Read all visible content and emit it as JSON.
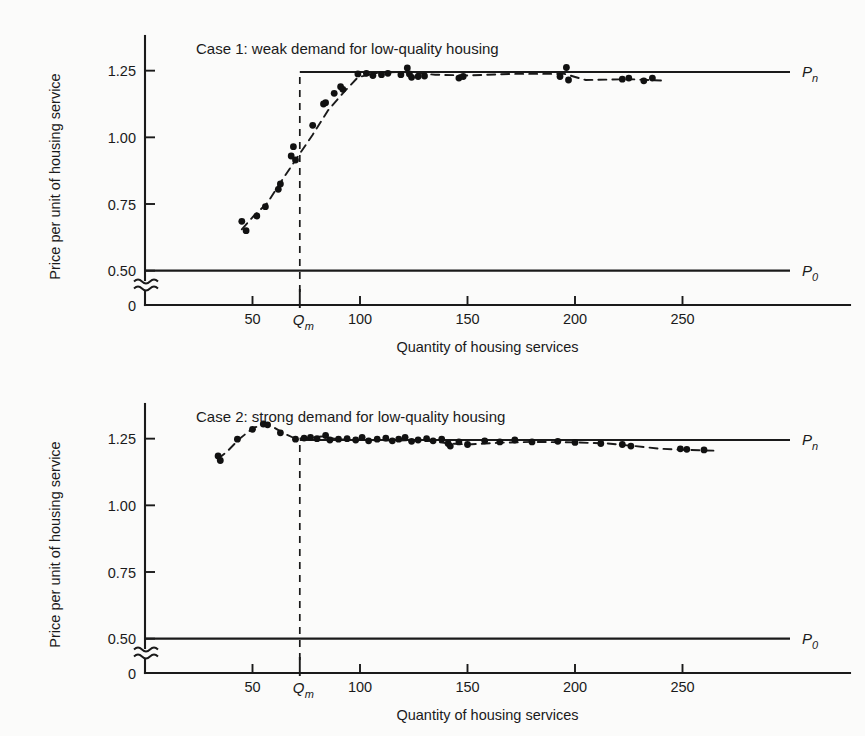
{
  "figure": {
    "background_color": "#fbfbfa",
    "ink_color": "#1a1a1a"
  },
  "chart_data": [
    {
      "type": "scatter",
      "panel_id": "case-1",
      "title": "Case 1: weak demand for  low-quality housing",
      "xlabel": "Quantity of housing services",
      "ylabel": "Price per unit of housing service",
      "xlim": [
        0,
        300
      ],
      "ylim": [
        0.42,
        1.38
      ],
      "grid": false,
      "legend_position": "right-of-axes",
      "xticks": [
        50,
        100,
        150,
        200,
        250
      ],
      "xticklabels": [
        "50",
        "100",
        "150",
        "200",
        "250"
      ],
      "yticks": [
        0.5,
        0.75,
        1.0,
        1.25
      ],
      "yticklabels": [
        "0.50",
        "0.75",
        "1.00",
        "1.25"
      ],
      "y_origin_label": "0",
      "axis_break": true,
      "annotations": [
        {
          "name": "qm-tick-label",
          "text": "Qm",
          "base": "Q",
          "sub": "m",
          "x": 72
        },
        {
          "name": "pn-line-label",
          "text": "Pn",
          "base": "P",
          "sub": "n",
          "y": 1.245
        },
        {
          "name": "p0-line-label",
          "text": "P0",
          "base": "P",
          "sub": "0",
          "y": 0.5
        }
      ],
      "reference_lines": [
        {
          "name": "pn",
          "label": "Pn",
          "value": 1.245,
          "start_x": 72,
          "style": "solid"
        },
        {
          "name": "p0",
          "label": "P0",
          "value": 0.5,
          "start_x": 0,
          "style": "solid"
        }
      ],
      "qm": 72,
      "fit_curve": [
        [
          45,
          0.655
        ],
        [
          50,
          0.7
        ],
        [
          57,
          0.755
        ],
        [
          63,
          0.83
        ],
        [
          70,
          0.915
        ],
        [
          78,
          1.01
        ],
        [
          85,
          1.1
        ],
        [
          92,
          1.165
        ],
        [
          99,
          1.225
        ],
        [
          108,
          1.242
        ],
        [
          120,
          1.245
        ],
        [
          135,
          1.235
        ],
        [
          150,
          1.232
        ],
        [
          170,
          1.238
        ],
        [
          195,
          1.238
        ],
        [
          205,
          1.215
        ],
        [
          225,
          1.218
        ],
        [
          240,
          1.213
        ]
      ],
      "points": [
        [
          45,
          0.685
        ],
        [
          47,
          0.65
        ],
        [
          52,
          0.705
        ],
        [
          56,
          0.74
        ],
        [
          62,
          0.805
        ],
        [
          63,
          0.825
        ],
        [
          68,
          0.93
        ],
        [
          69,
          0.965
        ],
        [
          70,
          0.915
        ],
        [
          78,
          1.045
        ],
        [
          83,
          1.125
        ],
        [
          84,
          1.13
        ],
        [
          88,
          1.165
        ],
        [
          91,
          1.19
        ],
        [
          92,
          1.18
        ],
        [
          99,
          1.238
        ],
        [
          103,
          1.24
        ],
        [
          106,
          1.232
        ],
        [
          110,
          1.235
        ],
        [
          113,
          1.24
        ],
        [
          119,
          1.235
        ],
        [
          122,
          1.26
        ],
        [
          123,
          1.238
        ],
        [
          124,
          1.225
        ],
        [
          127,
          1.228
        ],
        [
          130,
          1.23
        ],
        [
          146,
          1.222
        ],
        [
          148,
          1.228
        ],
        [
          193,
          1.228
        ],
        [
          196,
          1.262
        ],
        [
          197,
          1.215
        ],
        [
          222,
          1.218
        ],
        [
          225,
          1.222
        ],
        [
          232,
          1.212
        ],
        [
          236,
          1.222
        ]
      ]
    },
    {
      "type": "scatter",
      "panel_id": "case-2",
      "title": "Case 2: strong demand for low-quality housing",
      "xlabel": "Quantity of housing services",
      "ylabel": "Price per unit of housing service",
      "xlim": [
        0,
        300
      ],
      "ylim": [
        0.42,
        1.38
      ],
      "grid": false,
      "legend_position": "right-of-axes",
      "xticks": [
        50,
        100,
        150,
        200,
        250
      ],
      "xticklabels": [
        "50",
        "100",
        "150",
        "200",
        "250"
      ],
      "yticks": [
        0.5,
        0.75,
        1.0,
        1.25
      ],
      "yticklabels": [
        "0.50",
        "0.75",
        "1.00",
        "1.25"
      ],
      "y_origin_label": "0",
      "axis_break": true,
      "annotations": [
        {
          "name": "qm-tick-label",
          "text": "Qm",
          "base": "Q",
          "sub": "m",
          "x": 72
        },
        {
          "name": "pn-line-label",
          "text": "Pn",
          "base": "P",
          "sub": "n",
          "y": 1.245
        },
        {
          "name": "p0-line-label",
          "text": "P0",
          "base": "P",
          "sub": "0",
          "y": 0.5
        }
      ],
      "reference_lines": [
        {
          "name": "pn",
          "label": "Pn",
          "value": 1.245,
          "start_x": 72,
          "style": "solid"
        },
        {
          "name": "p0",
          "label": "P0",
          "value": 0.5,
          "start_x": 0,
          "style": "solid"
        }
      ],
      "qm": 72,
      "fit_curve": [
        [
          34,
          1.175
        ],
        [
          38,
          1.2
        ],
        [
          44,
          1.25
        ],
        [
          50,
          1.288
        ],
        [
          55,
          1.305
        ],
        [
          60,
          1.292
        ],
        [
          65,
          1.268
        ],
        [
          70,
          1.25
        ],
        [
          76,
          1.252
        ],
        [
          82,
          1.258
        ],
        [
          90,
          1.248
        ],
        [
          100,
          1.245
        ],
        [
          115,
          1.243
        ],
        [
          130,
          1.244
        ],
        [
          142,
          1.232
        ],
        [
          150,
          1.228
        ],
        [
          165,
          1.235
        ],
        [
          180,
          1.238
        ],
        [
          200,
          1.236
        ],
        [
          215,
          1.232
        ],
        [
          228,
          1.222
        ],
        [
          240,
          1.212
        ],
        [
          252,
          1.208
        ],
        [
          265,
          1.205
        ]
      ],
      "points": [
        [
          34,
          1.185
        ],
        [
          35,
          1.168
        ],
        [
          43,
          1.248
        ],
        [
          50,
          1.285
        ],
        [
          55,
          1.305
        ],
        [
          57,
          1.302
        ],
        [
          63,
          1.272
        ],
        [
          70,
          1.248
        ],
        [
          74,
          1.252
        ],
        [
          77,
          1.255
        ],
        [
          80,
          1.25
        ],
        [
          84,
          1.262
        ],
        [
          86,
          1.245
        ],
        [
          90,
          1.248
        ],
        [
          94,
          1.25
        ],
        [
          98,
          1.245
        ],
        [
          101,
          1.255
        ],
        [
          104,
          1.242
        ],
        [
          108,
          1.248
        ],
        [
          112,
          1.252
        ],
        [
          115,
          1.242
        ],
        [
          118,
          1.248
        ],
        [
          121,
          1.255
        ],
        [
          124,
          1.24
        ],
        [
          127,
          1.245
        ],
        [
          131,
          1.25
        ],
        [
          134,
          1.242
        ],
        [
          138,
          1.248
        ],
        [
          141,
          1.232
        ],
        [
          142,
          1.222
        ],
        [
          146,
          1.238
        ],
        [
          150,
          1.228
        ],
        [
          158,
          1.242
        ],
        [
          165,
          1.238
        ],
        [
          172,
          1.245
        ],
        [
          180,
          1.238
        ],
        [
          192,
          1.24
        ],
        [
          200,
          1.236
        ],
        [
          212,
          1.232
        ],
        [
          222,
          1.228
        ],
        [
          226,
          1.222
        ],
        [
          249,
          1.212
        ],
        [
          252,
          1.21
        ],
        [
          260,
          1.208
        ]
      ]
    }
  ]
}
